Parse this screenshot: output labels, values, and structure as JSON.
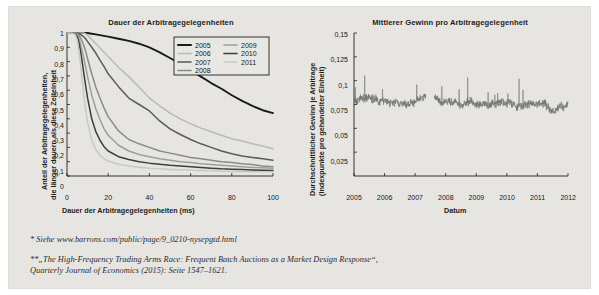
{
  "page": {
    "background_color": "#e9e7e4",
    "page_color": "#ffffff"
  },
  "charts": {
    "left": {
      "title": "Dauer der Arbitragegelegenheiten",
      "xlabel": "Dauer der Arbitragegelegenheiten (ms)",
      "ylabel_line1": "Anteil der Arbitragegelegenheiten,",
      "ylabel_line2": "die länger dauern als diese Zeiteinheit",
      "xticks": [
        "0",
        "20",
        "40",
        "60",
        "80",
        "100"
      ],
      "yticks": [
        "0",
        "0,1",
        "0,2",
        "0,3",
        "0,4",
        "0,5",
        "0,6",
        "0,7",
        "0,8",
        "0,9",
        "1"
      ],
      "legend": [
        {
          "label": "2005",
          "color": "#1a1a1a"
        },
        {
          "label": "2006",
          "color": "#b9b9b9"
        },
        {
          "label": "2007",
          "color": "#5a5a5a"
        },
        {
          "label": "2008",
          "color": "#8a8a8a"
        },
        {
          "label": "2009",
          "color": "#9e9e9e"
        },
        {
          "label": "2010",
          "color": "#3d3d3d"
        },
        {
          "label": "2011",
          "color": "#c8c8c8"
        }
      ]
    },
    "right": {
      "title": "Mittlerer Gewinn pro Arbitragegelegenheit",
      "xlabel": "Datum",
      "ylabel_line1": "Durchschnittlicher Gewinn je Arbitrage",
      "ylabel_line2": "(Indexpunkte pro gehandelter Einheit)",
      "xticks": [
        "2005",
        "2006",
        "2007",
        "2008",
        "2009",
        "2010",
        "2011",
        "2012"
      ],
      "yticks": [
        "0,025",
        "0,05",
        "0,075",
        "0,1",
        "0,125",
        "0,15"
      ],
      "series_color": "#6e6e6e"
    }
  },
  "footnotes": [
    "* Siehe www.barrons.com/public/page/9_0210-nysepgtd.html",
    "**„The High-Frequency Trading Arms Race: Frequent Batch Auctions as a Market Design Response“,",
    "Quarterly Journal of Economics (2015): Seite 1547–1621."
  ],
  "chart_data": [
    {
      "type": "line",
      "title": "Dauer der Arbitragegelegenheiten",
      "xlabel": "Dauer der Arbitragegelegenheiten (ms)",
      "ylabel": "Anteil der Arbitragegelegenheiten, die länger dauern als diese Zeiteinheit",
      "xlim": [
        0,
        100
      ],
      "ylim": [
        0,
        1
      ],
      "grid": false,
      "legend_position": "top-right",
      "x": [
        0,
        2,
        4,
        5,
        6,
        7,
        8,
        9,
        10,
        12,
        14,
        16,
        18,
        20,
        25,
        30,
        35,
        40,
        45,
        50,
        55,
        60,
        65,
        70,
        75,
        80,
        85,
        90,
        95,
        100
      ],
      "series": [
        {
          "name": "2005",
          "color": "#1a1a1a",
          "values": [
            1,
            1,
            1,
            1,
            1,
            1,
            1,
            1,
            1,
            0.995,
            0.99,
            0.985,
            0.98,
            0.975,
            0.96,
            0.945,
            0.925,
            0.9,
            0.865,
            0.825,
            0.785,
            0.74,
            0.695,
            0.65,
            0.61,
            0.565,
            0.525,
            0.49,
            0.46,
            0.44
          ]
        },
        {
          "name": "2006",
          "color": "#b9b9b9",
          "values": [
            1,
            1,
            1,
            1,
            1,
            1,
            1,
            0.995,
            0.985,
            0.955,
            0.925,
            0.895,
            0.865,
            0.835,
            0.76,
            0.695,
            0.62,
            0.545,
            0.49,
            0.44,
            0.4,
            0.365,
            0.335,
            0.31,
            0.285,
            0.26,
            0.245,
            0.225,
            0.21,
            0.19
          ]
        },
        {
          "name": "2007",
          "color": "#5a5a5a",
          "values": [
            1,
            1,
            1,
            1,
            0.995,
            0.985,
            0.975,
            0.96,
            0.94,
            0.9,
            0.86,
            0.81,
            0.765,
            0.715,
            0.625,
            0.545,
            0.5,
            0.455,
            0.385,
            0.33,
            0.29,
            0.255,
            0.225,
            0.2,
            0.175,
            0.155,
            0.14,
            0.13,
            0.12,
            0.11
          ]
        },
        {
          "name": "2008",
          "color": "#8a8a8a",
          "values": [
            1,
            1,
            1,
            0.995,
            0.98,
            0.955,
            0.92,
            0.875,
            0.82,
            0.715,
            0.62,
            0.545,
            0.475,
            0.415,
            0.315,
            0.255,
            0.225,
            0.2,
            0.175,
            0.16,
            0.145,
            0.13,
            0.12,
            0.11,
            0.1,
            0.095,
            0.085,
            0.08,
            0.07,
            0.065
          ]
        },
        {
          "name": "2009",
          "color": "#9e9e9e",
          "values": [
            1,
            1,
            1,
            0.99,
            0.955,
            0.9,
            0.835,
            0.765,
            0.695,
            0.565,
            0.47,
            0.395,
            0.33,
            0.285,
            0.215,
            0.175,
            0.15,
            0.135,
            0.12,
            0.11,
            0.1,
            0.095,
            0.085,
            0.08,
            0.075,
            0.07,
            0.065,
            0.06,
            0.058,
            0.055
          ]
        },
        {
          "name": "2010",
          "color": "#3d3d3d",
          "values": [
            1,
            1,
            0.995,
            0.975,
            0.92,
            0.835,
            0.735,
            0.635,
            0.545,
            0.4,
            0.31,
            0.25,
            0.205,
            0.175,
            0.135,
            0.115,
            0.1,
            0.09,
            0.082,
            0.075,
            0.07,
            0.065,
            0.06,
            0.055,
            0.05,
            0.048,
            0.045,
            0.042,
            0.04,
            0.038
          ]
        },
        {
          "name": "2011",
          "color": "#c8c8c8",
          "values": [
            1,
            1,
            0.99,
            0.95,
            0.85,
            0.72,
            0.585,
            0.465,
            0.375,
            0.25,
            0.185,
            0.145,
            0.12,
            0.105,
            0.082,
            0.07,
            0.062,
            0.055,
            0.05,
            0.046,
            0.043,
            0.04,
            0.038,
            0.036,
            0.034,
            0.032,
            0.031,
            0.03,
            0.029,
            0.028
          ]
        }
      ]
    },
    {
      "type": "line",
      "title": "Mittlerer Gewinn pro Arbitragegelegenheit",
      "xlabel": "Datum",
      "ylabel": "Durchschnittlicher Gewinn je Arbitrage (Indexpunkte pro gehandelter Einheit)",
      "xlim": [
        2005,
        2012
      ],
      "ylim": [
        0,
        0.15
      ],
      "grid": false,
      "legend_position": "none",
      "series_name": "Mittlerer Gewinn",
      "color": "#6e6e6e",
      "note": "Noisy daily series oscillating around 0,075–0,085 with gaps; spikes to ~0,107 (mid 2005), ~0,116 (late 2008), ~0,105 (mid 2010).",
      "approx_mean": 0.079,
      "spikes": [
        {
          "x": 2005.35,
          "y": 0.107
        },
        {
          "x": 2008.72,
          "y": 0.116
        },
        {
          "x": 2010.4,
          "y": 0.105
        }
      ],
      "gaps": [
        [
          2007.35,
          2007.62
        ]
      ]
    }
  ]
}
